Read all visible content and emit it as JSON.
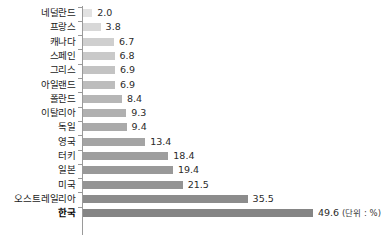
{
  "chart_data": {
    "type": "bar",
    "orientation": "horizontal",
    "title": "",
    "subtitle": "",
    "xlabel": "",
    "ylabel": "",
    "unit_note": "(단위 : %)",
    "grid": false,
    "legend": "none",
    "axis_visible": "category-axis-only",
    "xlim": [
      0,
      49.6
    ],
    "categories": [
      "네덜란드",
      "프랑스",
      "캐나다",
      "스페인",
      "그리스",
      "아일랜드",
      "폴란드",
      "이탈리아",
      "독일",
      "영국",
      "터키",
      "일본",
      "미국",
      "오스트레일리아",
      "한국"
    ],
    "values": [
      2.0,
      3.8,
      6.7,
      6.8,
      6.9,
      6.9,
      8.4,
      9.3,
      9.4,
      13.4,
      18.4,
      19.4,
      21.5,
      35.5,
      49.6
    ],
    "value_labels": [
      "2.0",
      "3.8",
      "6.7",
      "6.8",
      "6.9",
      "6.9",
      "8.4",
      "9.3",
      "9.4",
      "13.4",
      "18.4",
      "19.4",
      "21.5",
      "35.5",
      "49.6"
    ],
    "bar_colors": [
      "#e2e2e2",
      "#d8d8d8",
      "#cfcfcf",
      "#c9c9c9",
      "#c3c3c3",
      "#bdbdbd",
      "#b6b6b6",
      "#b0b0b0",
      "#aaaaaa",
      "#a4a4a4",
      "#9e9e9e",
      "#999999",
      "#949494",
      "#8c8c8c",
      "#858585"
    ],
    "highlight_category": "한국",
    "axis_color": "#9a9a9a"
  }
}
